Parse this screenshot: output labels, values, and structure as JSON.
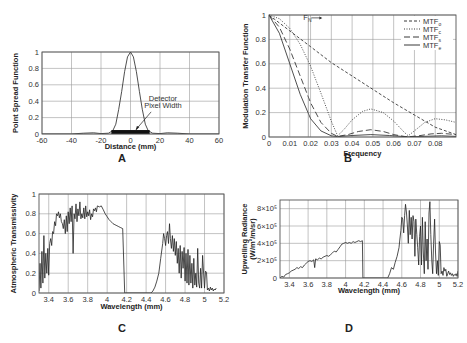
{
  "figure": {
    "panels": [
      "A",
      "B",
      "C",
      "D"
    ]
  },
  "chart_data": [
    {
      "panel": "A",
      "type": "line",
      "title": "",
      "xlabel": "Distance (mm)",
      "ylabel": "Point Spread Function",
      "xlim": [
        -60,
        60
      ],
      "ylim": [
        0,
        1
      ],
      "xticks": [
        -60,
        -40,
        -20,
        0,
        20,
        40,
        60
      ],
      "yticks": [
        0,
        0.2,
        0.4,
        0.6,
        0.8,
        1
      ],
      "grid": true,
      "annotations": [
        {
          "text": "Detector",
          "x": 22,
          "y": 0.4
        },
        {
          "text": "Pixel Width",
          "x": 22,
          "y": 0.32
        }
      ],
      "series": [
        {
          "name": "PSF",
          "style": "solid",
          "x": [
            -60,
            -40,
            -32,
            -25,
            -20,
            -15,
            -12,
            -10,
            -8,
            -6,
            -4,
            -2,
            0,
            2,
            4,
            6,
            8,
            10,
            12,
            15,
            20,
            25,
            32,
            40,
            60
          ],
          "y": [
            0,
            0,
            0.01,
            0.015,
            0.005,
            0.01,
            0.04,
            0.12,
            0.3,
            0.52,
            0.76,
            0.94,
            1,
            0.94,
            0.76,
            0.52,
            0.3,
            0.12,
            0.04,
            0.01,
            0.005,
            0.015,
            0.01,
            0,
            0
          ]
        },
        {
          "name": "Detector Pixel Width",
          "style": "bar",
          "x": [
            -13,
            13
          ],
          "y": [
            0.03,
            0.03
          ]
        }
      ]
    },
    {
      "panel": "B",
      "type": "line",
      "title": "",
      "xlabel": "Frequency",
      "ylabel": "Modulation Transfer Function",
      "xlim": [
        0,
        0.09
      ],
      "ylim": [
        0,
        1
      ],
      "xticks": [
        0,
        0.01,
        0.02,
        0.03,
        0.04,
        0.05,
        0.06,
        0.07,
        0.08
      ],
      "yticks": [
        0,
        0.2,
        0.4,
        0.6,
        0.8,
        1
      ],
      "grid": true,
      "annotations": [
        {
          "text": "F",
          "sub": "N",
          "x": 0.0165,
          "y": 0.96,
          "arrow": "right"
        }
      ],
      "legend": {
        "position": "upper right",
        "entries": [
          {
            "label": "MTF",
            "sub": "o",
            "style": "short-dash"
          },
          {
            "label": "MTF",
            "sub": "c",
            "style": "dotted"
          },
          {
            "label": "MTF",
            "sub": "s",
            "style": "long-dash"
          },
          {
            "label": "MTF",
            "sub": "e",
            "style": "solid"
          }
        ]
      },
      "series": [
        {
          "name": "MTFo",
          "style": "short-dash",
          "x": [
            0,
            0.01,
            0.02,
            0.03,
            0.04,
            0.05,
            0.06,
            0.07,
            0.08,
            0.09
          ],
          "y": [
            1,
            0.87,
            0.74,
            0.61,
            0.5,
            0.39,
            0.28,
            0.18,
            0.08,
            0.02
          ]
        },
        {
          "name": "MTFc",
          "style": "dotted",
          "x": [
            0,
            0.005,
            0.01,
            0.015,
            0.02,
            0.025,
            0.03,
            0.033,
            0.036,
            0.04,
            0.045,
            0.049,
            0.055,
            0.06,
            0.065,
            0.067,
            0.07,
            0.075,
            0.08,
            0.085,
            0.09
          ],
          "y": [
            1,
            0.97,
            0.89,
            0.76,
            0.58,
            0.36,
            0.13,
            0.01,
            0.06,
            0.14,
            0.21,
            0.23,
            0.2,
            0.13,
            0.04,
            0.01,
            0.05,
            0.12,
            0.15,
            0.14,
            0.12
          ]
        },
        {
          "name": "MTFs",
          "style": "long-dash",
          "x": [
            0,
            0.005,
            0.01,
            0.015,
            0.02,
            0.025,
            0.03,
            0.033,
            0.038,
            0.043,
            0.049,
            0.055,
            0.06,
            0.065,
            0.067,
            0.072,
            0.078,
            0.083,
            0.09
          ],
          "y": [
            1,
            0.9,
            0.72,
            0.5,
            0.28,
            0.12,
            0.03,
            0.005,
            0.02,
            0.045,
            0.06,
            0.045,
            0.02,
            0.005,
            0.002,
            0.01,
            0.025,
            0.03,
            0.02
          ]
        },
        {
          "name": "MTFe",
          "style": "solid",
          "x": [
            0,
            0.005,
            0.01,
            0.015,
            0.02,
            0.025,
            0.03,
            0.033,
            0.04,
            0.049,
            0.058,
            0.067,
            0.075,
            0.083,
            0.09
          ],
          "y": [
            1,
            0.85,
            0.6,
            0.35,
            0.15,
            0.05,
            0.01,
            0.003,
            0.012,
            0.02,
            0.012,
            0.001,
            0.006,
            0.01,
            0.005
          ]
        }
      ]
    },
    {
      "panel": "C",
      "type": "line",
      "title": "",
      "xlabel": "Wavelength (mm)",
      "ylabel": "Atmospheric Transmissivity",
      "xlim": [
        3.3,
        5.2
      ],
      "ylim": [
        0,
        1
      ],
      "xticks": [
        3.4,
        3.6,
        3.8,
        4,
        4.2,
        4.4,
        4.6,
        4.8,
        5,
        5.2
      ],
      "yticks": [
        0,
        0.2,
        0.4,
        0.6,
        0.8,
        1
      ],
      "grid": true,
      "series": [
        {
          "name": "Transmissivity",
          "style": "solid",
          "x": [
            3.3,
            3.31,
            3.32,
            3.33,
            3.34,
            3.35,
            3.36,
            3.37,
            3.38,
            3.39,
            3.4,
            3.41,
            3.42,
            3.43,
            3.44,
            3.45,
            3.46,
            3.47,
            3.48,
            3.49,
            3.5,
            3.51,
            3.52,
            3.53,
            3.54,
            3.55,
            3.56,
            3.57,
            3.58,
            3.59,
            3.6,
            3.61,
            3.62,
            3.63,
            3.64,
            3.65,
            3.66,
            3.67,
            3.68,
            3.69,
            3.7,
            3.71,
            3.72,
            3.73,
            3.74,
            3.75,
            3.76,
            3.77,
            3.78,
            3.79,
            3.8,
            3.81,
            3.82,
            3.83,
            3.84,
            3.85,
            3.86,
            3.87,
            3.88,
            3.89,
            3.9,
            3.92,
            3.94,
            3.96,
            3.98,
            4.0,
            4.02,
            4.04,
            4.06,
            4.08,
            4.1,
            4.12,
            4.14,
            4.16,
            4.18,
            4.185,
            4.19,
            4.45,
            4.47,
            4.49,
            4.51,
            4.53,
            4.55,
            4.57,
            4.58,
            4.59,
            4.6,
            4.61,
            4.62,
            4.63,
            4.64,
            4.65,
            4.66,
            4.67,
            4.68,
            4.69,
            4.7,
            4.71,
            4.72,
            4.73,
            4.74,
            4.75,
            4.76,
            4.77,
            4.78,
            4.79,
            4.8,
            4.81,
            4.82,
            4.83,
            4.84,
            4.85,
            4.86,
            4.87,
            4.88,
            4.89,
            4.9,
            4.91,
            4.92,
            4.93,
            4.94,
            4.95,
            4.96,
            4.97,
            4.98,
            4.99,
            5.0,
            5.01,
            5.02,
            5.03,
            5.04,
            5.05,
            5.06,
            5.07,
            5.08,
            5.09,
            5.1,
            5.11,
            5.12,
            5.13,
            5.14,
            5.15,
            5.16,
            5.17,
            5.18,
            5.19,
            5.2
          ],
          "y": [
            0.02,
            0.3,
            0.05,
            0.42,
            0.1,
            0.58,
            0.15,
            0.4,
            0.2,
            0.45,
            0.18,
            0.5,
            0.55,
            0.48,
            0.62,
            0.6,
            0.72,
            0.68,
            0.8,
            0.78,
            0.82,
            0.76,
            0.8,
            0.72,
            0.7,
            0.65,
            0.74,
            0.6,
            0.78,
            0.62,
            0.82,
            0.7,
            0.86,
            0.72,
            0.88,
            0.4,
            0.8,
            0.75,
            0.9,
            0.72,
            0.85,
            0.78,
            0.92,
            0.75,
            0.8,
            0.76,
            0.86,
            0.75,
            0.88,
            0.77,
            0.82,
            0.78,
            0.84,
            0.74,
            0.8,
            0.77,
            0.85,
            0.83,
            0.86,
            0.82,
            0.88,
            0.87,
            0.88,
            0.84,
            0.8,
            0.77,
            0.74,
            0.72,
            0.7,
            0.69,
            0.68,
            0.67,
            0.66,
            0.65,
            0.0,
            0.0,
            0.0,
            0.0,
            0.02,
            0.06,
            0.12,
            0.2,
            0.35,
            0.5,
            0.6,
            0.55,
            0.48,
            0.58,
            0.62,
            0.5,
            0.7,
            0.55,
            0.45,
            0.58,
            0.42,
            0.55,
            0.38,
            0.52,
            0.3,
            0.45,
            0.2,
            0.48,
            0.15,
            0.42,
            0.25,
            0.46,
            0.12,
            0.4,
            0.1,
            0.44,
            0.08,
            0.38,
            0.1,
            0.3,
            0.05,
            0.35,
            0.08,
            0.2,
            0.06,
            0.45,
            0.1,
            0.05,
            0.25,
            0.05,
            0.38,
            0.2,
            0.05,
            0.22,
            0.21,
            0.03,
            0.05,
            0.02,
            0.06,
            0.03,
            0.05,
            0.02,
            0.04,
            0.03,
            0.05
          ]
        }
      ]
    },
    {
      "panel": "D",
      "type": "line",
      "title": "",
      "xlabel": "Wavelength (mm)",
      "ylabel": "Upwelling Radiance",
      "ylabel2": "(W/m²/m/sr)",
      "xlim": [
        3.3,
        5.2
      ],
      "ylim": [
        0,
        9e-05
      ],
      "xticks": [
        3.4,
        3.6,
        3.8,
        4,
        4.2,
        4.4,
        4.6,
        4.8,
        5,
        5.2
      ],
      "yticks": [
        0,
        2e-05,
        4e-05,
        6e-05,
        8e-05
      ],
      "ytick_labels": [
        "0",
        "2×10⁵",
        "4×10⁵",
        "6×10⁵",
        "8×10⁵"
      ],
      "grid": true,
      "series": [
        {
          "name": "Radiance",
          "style": "solid",
          "x": [
            3.3,
            3.32,
            3.34,
            3.36,
            3.38,
            3.4,
            3.42,
            3.44,
            3.46,
            3.48,
            3.5,
            3.52,
            3.54,
            3.56,
            3.58,
            3.6,
            3.62,
            3.64,
            3.66,
            3.67,
            3.68,
            3.7,
            3.72,
            3.74,
            3.76,
            3.78,
            3.8,
            3.82,
            3.84,
            3.86,
            3.88,
            3.9,
            3.92,
            3.94,
            3.96,
            3.98,
            4.0,
            4.02,
            4.04,
            4.06,
            4.08,
            4.1,
            4.12,
            4.14,
            4.16,
            4.18,
            4.185,
            4.19,
            4.45,
            4.47,
            4.49,
            4.51,
            4.53,
            4.55,
            4.57,
            4.58,
            4.59,
            4.6,
            4.61,
            4.62,
            4.63,
            4.64,
            4.65,
            4.66,
            4.67,
            4.68,
            4.69,
            4.7,
            4.71,
            4.72,
            4.73,
            4.74,
            4.75,
            4.76,
            4.77,
            4.78,
            4.79,
            4.8,
            4.81,
            4.82,
            4.83,
            4.84,
            4.85,
            4.86,
            4.87,
            4.88,
            4.89,
            4.9,
            4.91,
            4.92,
            4.93,
            4.94,
            4.95,
            4.96,
            4.97,
            4.98,
            4.99,
            5.0,
            5.01,
            5.02,
            5.03,
            5.04,
            5.05,
            5.06,
            5.07,
            5.08,
            5.09,
            5.1,
            5.11,
            5.12,
            5.13,
            5.14,
            5.15,
            5.16,
            5.17,
            5.18,
            5.19,
            5.2
          ],
          "y": [
            0,
            2e-06,
            1e-06,
            4e-06,
            5e-06,
            6e-06,
            8e-06,
            9e-06,
            1e-05,
            1.2e-05,
            1.1e-05,
            1.3e-05,
            1.2e-05,
            1.5e-05,
            1.7e-05,
            1.9e-05,
            2e-05,
            1.9e-05,
            2.1e-05,
            1.2e-05,
            2.2e-05,
            2.1e-05,
            2.3e-05,
            2.2e-05,
            2.4e-05,
            2.5e-05,
            2.6e-05,
            2.5e-05,
            2.7e-05,
            2.9e-05,
            3.1e-05,
            3e-05,
            3.3e-05,
            3.6e-05,
            3.9e-05,
            4e-05,
            4.1e-05,
            4e-05,
            4.1e-05,
            4e-05,
            4.2e-05,
            4.1e-05,
            4.2e-05,
            4.3e-05,
            4.2e-05,
            4.3e-05,
            0,
            0,
            0,
            5e-06,
            1.2e-05,
            1e-05,
            1.8e-05,
            2.5e-05,
            3.5e-05,
            4.5e-05,
            5.5e-05,
            7e-05,
            6.8e-05,
            5.2e-05,
            7.2e-05,
            8.5e-05,
            7.5e-05,
            6e-05,
            4e-05,
            7.8e-05,
            5e-05,
            7e-05,
            4.5e-05,
            7.2e-05,
            6.5e-05,
            2.5e-05,
            6.8e-05,
            5e-05,
            3.5e-05,
            1.5e-05,
            4.8e-05,
            6e-05,
            1.5e-05,
            7e-05,
            3e-05,
            5e-06,
            6.5e-05,
            2e-05,
            4.5e-05,
            1e-05,
            7.5e-05,
            8.8e-05,
            5e-05,
            2e-05,
            5e-06,
            4e-05,
            6.8e-05,
            3e-05,
            5e-06,
            2e-05,
            3e-06,
            4.2e-05,
            3.8e-05,
            5e-06,
            8e-06,
            3e-06,
            1.2e-05,
            8e-06,
            1e-05,
            2e-06,
            5e-06,
            8e-06,
            4e-06,
            6e-06,
            3e-06,
            5e-06,
            2e-06,
            4e-06,
            3e-06,
            5e-06,
            2e-06,
            8e-06,
            6e-06,
            4e-06
          ]
        }
      ]
    }
  ]
}
